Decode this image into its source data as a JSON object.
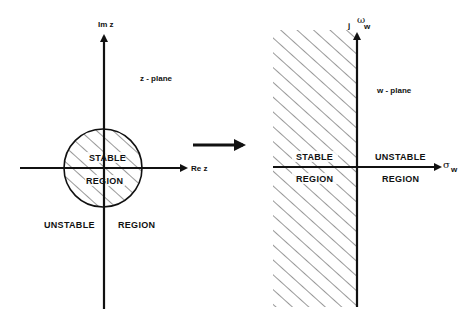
{
  "figure": {
    "type": "z-plane to w-plane stability mapping",
    "z_plane": {
      "plane_label": "z - plane",
      "real_axis_label": "Re z",
      "imag_axis_label": "Im z",
      "inside_circle_top": "STABLE",
      "inside_circle_bottom": "REGION",
      "outside_left": "UNSTABLE",
      "outside_right": "REGION"
    },
    "mapping_arrow": "→",
    "w_plane": {
      "plane_label": "w - plane",
      "real_axis_symbol": "σ",
      "real_axis_subscript": "w",
      "imag_axis_prefix": "j",
      "imag_axis_symbol": "ω",
      "imag_axis_subscript": "w",
      "left_half_top": "STABLE",
      "left_half_bottom": "REGION",
      "right_half_top": "UNSTABLE",
      "right_half_bottom": "REGION"
    },
    "colors": {
      "ink": "#111111",
      "hatch": "#333333",
      "background": "#ffffff"
    }
  }
}
